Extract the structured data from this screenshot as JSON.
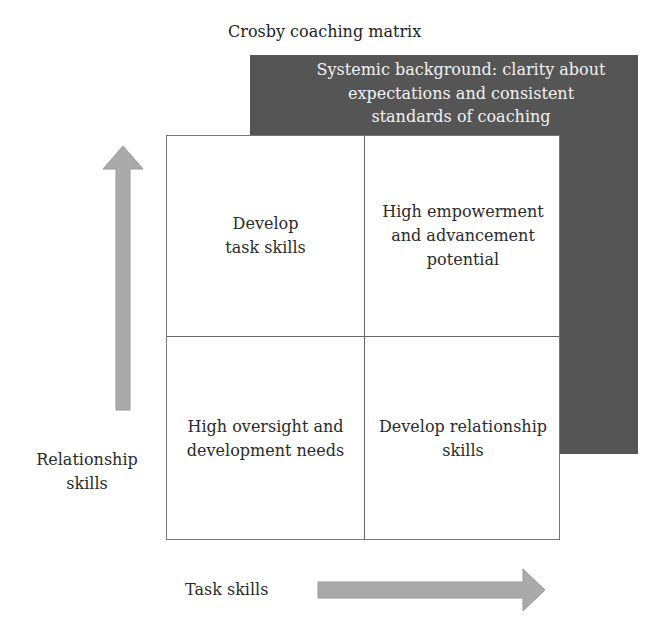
{
  "title": "Crosby coaching matrix",
  "background_box": {
    "text": "Systemic background: clarity about\nexpectations and consistent\nstandards of coaching",
    "color": "#555555"
  },
  "quadrants": {
    "top_left": "Develop\ntask skills",
    "top_right": "High empowerment\nand advancement\npotential",
    "bottom_left": "High oversight and\ndevelopment needs",
    "bottom_right": "Develop relationship\nskills"
  },
  "axes": {
    "y_label": "Relationship\nskills",
    "x_label": "Task skills",
    "arrow_color": "#aaaaaa"
  }
}
